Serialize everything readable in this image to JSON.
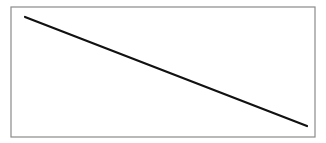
{
  "diagram": {
    "frame": {
      "x": 11,
      "y": 7,
      "width": 304,
      "height": 130,
      "stroke": "#8a8a8a",
      "stroke_width": 1.2
    },
    "line": {
      "x1": 25,
      "y1": 17,
      "x2": 307,
      "y2": 126,
      "stroke": "#111111",
      "stroke_width": 2.2
    }
  }
}
